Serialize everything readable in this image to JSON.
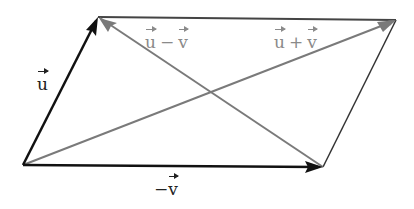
{
  "diagram": {
    "vertices": {
      "A": [
        23,
        165
      ],
      "B": [
        98,
        17
      ],
      "C": [
        396,
        20
      ],
      "D": [
        323,
        167
      ]
    },
    "colors": {
      "primary_vector": "#111111",
      "diagonal_vector": "#7a7a7a",
      "edge_top": "#444444",
      "edge_right": "#333333"
    },
    "vectors": [
      {
        "id": "u",
        "from": "A",
        "to": "B",
        "style": "primary"
      },
      {
        "id": "neg_v",
        "from": "A",
        "to": "D",
        "style": "primary"
      },
      {
        "id": "u_minus_v",
        "from": "D",
        "to": "B",
        "style": "diagonal"
      },
      {
        "id": "u_plus_v",
        "from": "A",
        "to": "C",
        "style": "diagonal"
      }
    ],
    "labels": {
      "u": {
        "var": "u"
      },
      "neg_v": {
        "sign": "−",
        "var": "v"
      },
      "u_minus_v": {
        "left": "u",
        "op": "−",
        "right": "v"
      },
      "u_plus_v": {
        "left": "u",
        "op": "+",
        "right": "v"
      }
    }
  }
}
